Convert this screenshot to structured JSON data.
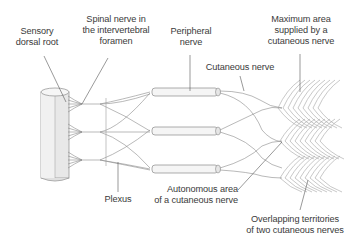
{
  "diagram": {
    "colors": {
      "stroke": "#8a8a8a",
      "text": "#3a3a3a",
      "cord_fill": "#e6e6e6",
      "tube_fill": "#f4f4f4",
      "leader": "#555555"
    },
    "labels": {
      "sensory_dorsal_root": [
        "Sensory",
        "dorsal root"
      ],
      "spinal_nerve": [
        "Spinal nerve in",
        "the intervertebral",
        "foramen"
      ],
      "peripheral_nerve": [
        "Peripheral",
        "nerve"
      ],
      "maximum_area": [
        "Maximum area",
        "supplied by a",
        "cutaneous nerve"
      ],
      "cutaneous_nerve": [
        "Cutaneous nerve"
      ],
      "plexus": [
        "Plexus"
      ],
      "autonomous_area": [
        "Autonomous area",
        "of a cutaneous nerve"
      ],
      "overlapping": [
        "Overlapping territories",
        "of two cutaneous nerves"
      ]
    }
  }
}
